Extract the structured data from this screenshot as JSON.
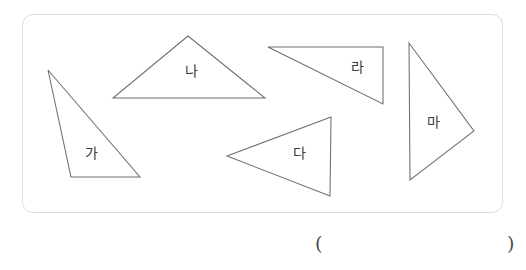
{
  "page": {
    "background_color": "#ffffff",
    "width": 526,
    "height": 270
  },
  "shape_box": {
    "name": "figure-frame",
    "border_color": "#dcdcdc",
    "fill_color": "#ffffff",
    "x": 22,
    "y": 14,
    "width": 481,
    "height": 199,
    "corner_radius": 11
  },
  "figure": {
    "stroke_color": "#6e6e6e",
    "fill_color": "#ffffff",
    "label_color": "#3a3a3a",
    "shape_type": "triangle",
    "count": 5,
    "triangles": [
      {
        "label": "가",
        "points": "48,70 71,177 140,177",
        "label_x": 91,
        "label_y": 154,
        "orientation": "obtuse-scalene-right-leaning"
      },
      {
        "label": "나",
        "points": "188,36 113,98 265,98",
        "label_x": 191,
        "label_y": 72,
        "orientation": "upright-acute"
      },
      {
        "label": "다",
        "points": "227,156 331,117 330,196",
        "label_x": 299,
        "label_y": 154,
        "orientation": "pointing-left"
      },
      {
        "label": "라",
        "points": "268,47 383,47 383,104",
        "label_x": 357,
        "label_y": 68,
        "orientation": "right-triangle-top-edge"
      },
      {
        "label": "마",
        "points": "409,43 410,180 474,131",
        "label_x": 433,
        "label_y": 123,
        "orientation": "pointing-right"
      }
    ]
  },
  "answer": {
    "open_paren": "(",
    "close_paren": ")"
  }
}
